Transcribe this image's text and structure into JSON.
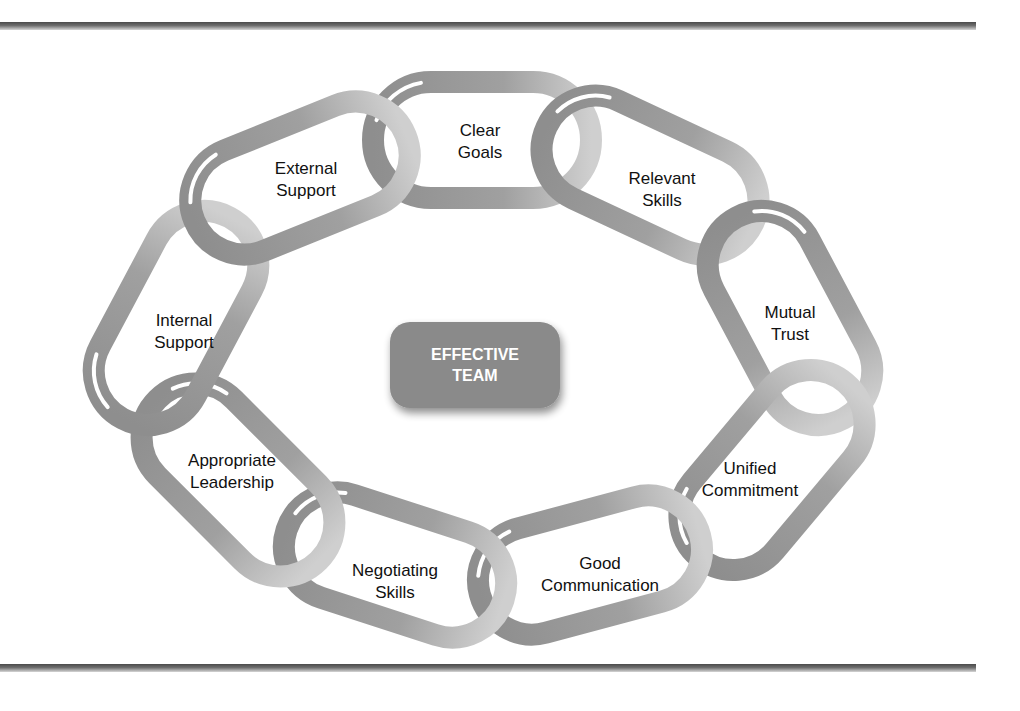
{
  "center": {
    "line1": "EFFECTIVE",
    "line2": "TEAM"
  },
  "links": [
    {
      "id": "clear-goals",
      "line1": "Clear",
      "line2": "Goals"
    },
    {
      "id": "relevant-skills",
      "line1": "Relevant",
      "line2": "Skills"
    },
    {
      "id": "mutual-trust",
      "line1": "Mutual",
      "line2": "Trust"
    },
    {
      "id": "unified-commitment",
      "line1": "Unified",
      "line2": "Commitment"
    },
    {
      "id": "good-communication",
      "line1": "Good",
      "line2": "Communication"
    },
    {
      "id": "negotiating-skills",
      "line1": "Negotiating",
      "line2": "Skills"
    },
    {
      "id": "appropriate-leadership",
      "line1": "Appropriate",
      "line2": "Leadership"
    },
    {
      "id": "internal-support",
      "line1": "Internal",
      "line2": "Support"
    },
    {
      "id": "external-support",
      "line1": "External",
      "line2": "Support"
    }
  ],
  "colors": {
    "chain": "#9a9a9a",
    "chain_light": "#c8c8c8",
    "center_box": "#8a8a8a",
    "text": "#111111"
  }
}
